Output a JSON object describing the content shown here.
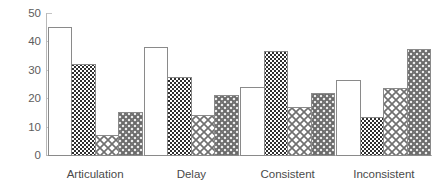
{
  "chart_data": {
    "type": "bar",
    "title": "",
    "subtitle": "",
    "xlabel": "",
    "ylabel": "",
    "categories": [
      "Articulation",
      "Delay",
      "Consistent",
      "Inconsistent"
    ],
    "series": [
      {
        "name": "Series 1",
        "fill": "white",
        "values": [
          45,
          38,
          24,
          26.5
        ]
      },
      {
        "name": "Series 2",
        "fill": "dark-checker",
        "values": [
          32,
          27.5,
          36.5,
          13.5
        ]
      },
      {
        "name": "Series 3",
        "fill": "light-crosshatch",
        "values": [
          7,
          14,
          17,
          23.5
        ]
      },
      {
        "name": "Series 4",
        "fill": "medium-crosshatch",
        "values": [
          15,
          21,
          22,
          37.5
        ]
      }
    ],
    "ylim": [
      0,
      50
    ],
    "yticks": [
      0,
      10,
      20,
      30,
      40,
      50
    ],
    "ytick_labels": [
      "0",
      "10",
      "20",
      "30",
      "40",
      "50"
    ],
    "grid": false,
    "legend": "none",
    "colors": {
      "axis": "#b9b9b9",
      "tick_text": "#5d5d5d",
      "category_text": "#4a4a4a",
      "bar_outline": "#8a8a8a",
      "background": "#ffffff",
      "pattern_dark": "#3a3a3a",
      "pattern_light": "#9a9a9a"
    }
  }
}
